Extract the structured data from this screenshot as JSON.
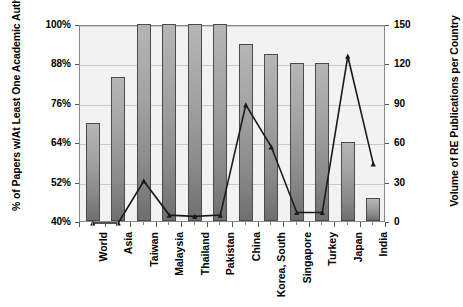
{
  "chart_data": {
    "type": "bar",
    "title": "",
    "xlabel": "",
    "categories": [
      "World",
      "Asia",
      "Taiwan",
      "Malaysia",
      "Thailand",
      "Pakistan",
      "China",
      "Korea, South",
      "Singapore",
      "Turkey",
      "Japan",
      "India"
    ],
    "grid": true,
    "legend": "none",
    "series": [
      {
        "name": "% of Papers w/At Least One Academic Author",
        "type": "bar",
        "axis": "left",
        "values": [
          70,
          84,
          100,
          100,
          100,
          100,
          94,
          91,
          88,
          88,
          64,
          47
        ]
      },
      {
        "name": "Volume of RE Publications per Country",
        "type": "line",
        "axis": "right",
        "values": [
          0,
          0,
          32,
          6,
          5,
          6,
          90,
          58,
          8,
          8,
          127,
          45
        ]
      }
    ],
    "axes": {
      "left": {
        "label": "% of Papers w/At Least One Academic Author",
        "ylim": [
          40,
          100
        ],
        "ticks": [
          40,
          52,
          64,
          76,
          88,
          100
        ],
        "tick_labels": [
          "40%",
          "52%",
          "64%",
          "76%",
          "88%",
          "100%"
        ]
      },
      "right": {
        "label": "Volume of RE Publications per Country",
        "ylim": [
          0,
          150
        ],
        "ticks": [
          0,
          30,
          60,
          90,
          120,
          150
        ],
        "tick_labels": [
          "0",
          "30",
          "60",
          "90",
          "120",
          "150"
        ]
      }
    },
    "colors": {
      "bar_fill": "#9a9a9a",
      "bar_border": "#4a4a4a",
      "line": "#1a1a1a",
      "plot_background": "#f2f2f2",
      "gridline": "#c9c9c9"
    }
  }
}
